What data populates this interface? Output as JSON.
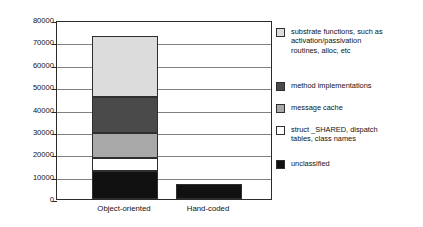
{
  "chart_data": {
    "type": "bar",
    "subtype": "stacked-bar",
    "title": "",
    "xlabel": "",
    "ylabel": "",
    "ylim": [
      0,
      80000
    ],
    "ytick_labels": [
      "80000",
      "70000",
      "60000",
      "50000",
      "40000",
      "30000",
      "20000",
      "10000",
      "0"
    ],
    "ytick_values": [
      80000,
      70000,
      60000,
      50000,
      40000,
      30000,
      20000,
      10000,
      0
    ],
    "grid": true,
    "legend_position": "right",
    "categories": [
      "Object-oriented",
      "Hand-coded"
    ],
    "series": [
      {
        "name": "unclassified",
        "color": "#111111",
        "values": [
          12500,
          6700
        ]
      },
      {
        "name": "struct _SHARED, dispatch tables, class names",
        "color": "#ffffff",
        "values": [
          6000,
          0
        ]
      },
      {
        "name": "message cache",
        "color": "#a8a8a8",
        "values": [
          11000,
          0
        ]
      },
      {
        "name": "method implementations",
        "color": "#4a4a4a",
        "values": [
          16000,
          0
        ]
      },
      {
        "name": "substrate functions, such as activation/passivation routines, alloc, etc",
        "color": "#dcdcdc",
        "values": [
          27300,
          0
        ]
      }
    ],
    "totals": [
      72800,
      6700
    ]
  },
  "axis": {
    "ticks": [
      {
        "label": "80000",
        "value": 80000
      },
      {
        "label": "70000",
        "value": 70000
      },
      {
        "label": "60000",
        "value": 60000
      },
      {
        "label": "50000",
        "value": 50000
      },
      {
        "label": "40000",
        "value": 40000
      },
      {
        "label": "30000",
        "value": 30000
      },
      {
        "label": "20000",
        "value": 20000
      },
      {
        "label": "10000",
        "value": 10000
      },
      {
        "label": "0",
        "value": 0
      }
    ],
    "categories": [
      {
        "label": "Object-oriented"
      },
      {
        "label": "Hand-coded"
      }
    ]
  },
  "legend": {
    "items": [
      {
        "label": "substrate functions, such as\nactivation/passivation\nroutines, alloc, etc",
        "color": "#dcdcdc",
        "name": "substrate-functions"
      },
      {
        "label": "method implementations",
        "color": "#4a4a4a",
        "name": "method-implementations"
      },
      {
        "label": "message cache",
        "color": "#a8a8a8",
        "name": "message-cache"
      },
      {
        "label": "struct _SHARED, dispatch\ntables, class names",
        "color": "#ffffff",
        "name": "struct-shared"
      },
      {
        "label": "unclassified",
        "color": "#111111",
        "name": "unclassified"
      }
    ]
  },
  "colors": {
    "axis": "#2b2b2b",
    "grid": "#808080",
    "background": "#ffffff",
    "text": "#111111"
  }
}
